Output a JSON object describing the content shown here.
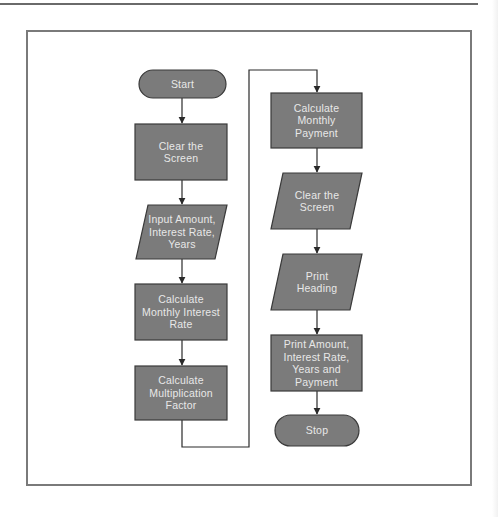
{
  "figure": {
    "colors": {
      "node_fill": "#7b7b7b",
      "node_stroke": "#3a3a3a",
      "node_text": "#e8e8e8",
      "connector": "#2a2a2a",
      "frame": "#7a7a7a"
    },
    "nodes": [
      {
        "id": "start",
        "shape": "terminator",
        "label": "Start"
      },
      {
        "id": "clear-screen-1",
        "shape": "process",
        "label": "Clear the Screen"
      },
      {
        "id": "input",
        "shape": "data",
        "label": "Input Amount, Interest Rate, Years"
      },
      {
        "id": "calc-rate",
        "shape": "process",
        "label": "Calculate Monthly Interest Rate"
      },
      {
        "id": "calc-factor",
        "shape": "process",
        "label": "Calculate Multiplication Factor"
      },
      {
        "id": "calc-payment",
        "shape": "process",
        "label": "Calculate Monthly Payment"
      },
      {
        "id": "clear-screen-2",
        "shape": "data",
        "label": "Clear the Screen"
      },
      {
        "id": "print-heading",
        "shape": "data",
        "label": "Print Heading"
      },
      {
        "id": "print-results",
        "shape": "process",
        "label": "Print Amount, Interest Rate, Years and Payment"
      },
      {
        "id": "stop",
        "shape": "terminator",
        "label": "Stop"
      }
    ],
    "edges": [
      [
        "start",
        "clear-screen-1"
      ],
      [
        "clear-screen-1",
        "input"
      ],
      [
        "input",
        "calc-rate"
      ],
      [
        "calc-rate",
        "calc-factor"
      ],
      [
        "calc-factor",
        "calc-payment"
      ],
      [
        "calc-payment",
        "clear-screen-2"
      ],
      [
        "clear-screen-2",
        "print-heading"
      ],
      [
        "print-heading",
        "print-results"
      ],
      [
        "print-results",
        "stop"
      ]
    ]
  }
}
